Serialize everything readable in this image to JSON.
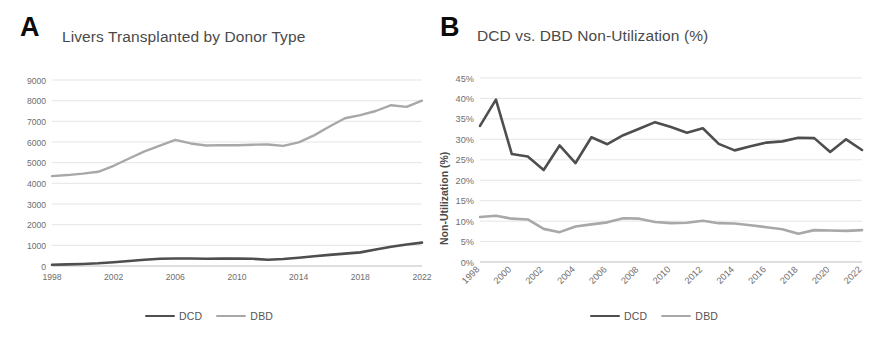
{
  "figure": {
    "panels": [
      {
        "letter": "A",
        "title": "Livers Transplanted by Donor Type"
      },
      {
        "letter": "B",
        "title": "DCD vs. DBD Non-Utilization (%)"
      }
    ]
  },
  "legend": {
    "dcd_label": "DCD",
    "dbd_label": "DBD",
    "dcd_color": "#4e4e4e",
    "dbd_color": "#a8a8a8"
  },
  "chart_data": [
    {
      "type": "line",
      "panel": "A",
      "title": "Livers Transplanted by Donor Type",
      "xlabel": "",
      "ylabel": "",
      "ylim": [
        0,
        9000
      ],
      "ytick_labels": [
        "0",
        "1000",
        "2000",
        "3000",
        "4000",
        "5000",
        "6000",
        "7000",
        "8000",
        "9000"
      ],
      "ytick_values": [
        0,
        1000,
        2000,
        3000,
        4000,
        5000,
        6000,
        7000,
        8000,
        9000
      ],
      "xlim": [
        1998,
        2022
      ],
      "xtick_labels": [
        "1998",
        "2002",
        "2006",
        "2010",
        "2014",
        "2018",
        "2022"
      ],
      "xtick_values": [
        1998,
        2002,
        2006,
        2010,
        2014,
        2018,
        2022
      ],
      "grid": true,
      "legend_position": "bottom",
      "x": [
        1998,
        1999,
        2000,
        2001,
        2002,
        2003,
        2004,
        2005,
        2006,
        2007,
        2008,
        2009,
        2010,
        2011,
        2012,
        2013,
        2014,
        2015,
        2016,
        2017,
        2018,
        2019,
        2020,
        2021,
        2022
      ],
      "series": [
        {
          "name": "DCD",
          "color": "#4e4e4e",
          "values": [
            60,
            80,
            100,
            130,
            180,
            240,
            300,
            350,
            360,
            360,
            350,
            355,
            355,
            350,
            300,
            340,
            400,
            470,
            540,
            600,
            660,
            800,
            930,
            1040,
            1130
          ]
        },
        {
          "name": "DBD",
          "color": "#a8a8a8",
          "values": [
            4350,
            4400,
            4470,
            4560,
            4850,
            5200,
            5550,
            5820,
            6100,
            5930,
            5830,
            5850,
            5840,
            5870,
            5880,
            5810,
            5980,
            6320,
            6750,
            7150,
            7300,
            7500,
            7780,
            7700,
            8000
          ]
        }
      ]
    },
    {
      "type": "line",
      "panel": "B",
      "title": "DCD vs. DBD Non-Utilization (%)",
      "xlabel": "",
      "ylabel": "Non-Utilization (%)",
      "ylim": [
        0,
        45
      ],
      "ytick_labels": [
        "0%",
        "5%",
        "10%",
        "15%",
        "20%",
        "25%",
        "30%",
        "35%",
        "40%",
        "45%"
      ],
      "ytick_values": [
        0,
        5,
        10,
        15,
        20,
        25,
        30,
        35,
        40,
        45
      ],
      "xlim": [
        1998,
        2022
      ],
      "xtick_labels": [
        "1998",
        "2000",
        "2002",
        "2004",
        "2006",
        "2008",
        "2010",
        "2012",
        "2014",
        "2016",
        "2018",
        "2020",
        "2022"
      ],
      "xtick_values": [
        1998,
        2000,
        2002,
        2004,
        2006,
        2008,
        2010,
        2012,
        2014,
        2016,
        2018,
        2020,
        2022
      ],
      "xtick_rotation": -45,
      "grid": true,
      "legend_position": "bottom",
      "x": [
        1998,
        1999,
        2000,
        2001,
        2002,
        2003,
        2004,
        2005,
        2006,
        2007,
        2008,
        2009,
        2010,
        2011,
        2012,
        2013,
        2014,
        2015,
        2016,
        2017,
        2018,
        2019,
        2020,
        2021,
        2022
      ],
      "series": [
        {
          "name": "DCD",
          "color": "#4e4e4e",
          "values": [
            33.3,
            39.7,
            26.4,
            25.8,
            22.5,
            28.5,
            24.2,
            30.5,
            28.8,
            31.0,
            32.6,
            34.2,
            33.0,
            31.6,
            32.7,
            28.9,
            27.3,
            28.3,
            29.2,
            29.5,
            30.4,
            30.3,
            26.9,
            30.0,
            27.4
          ]
        },
        {
          "name": "DBD",
          "color": "#a8a8a8",
          "values": [
            11.0,
            11.3,
            10.6,
            10.4,
            8.1,
            7.3,
            8.7,
            9.2,
            9.7,
            10.7,
            10.6,
            9.8,
            9.5,
            9.6,
            10.1,
            9.5,
            9.4,
            9.0,
            8.5,
            8.0,
            6.9,
            7.8,
            7.7,
            7.6,
            7.8
          ]
        }
      ]
    }
  ]
}
